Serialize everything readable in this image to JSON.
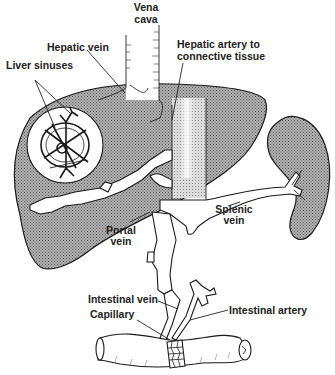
{
  "diagram": {
    "colors": {
      "organ_stipple": "#8a8a8a",
      "background": "#ffffff",
      "ink": "#1a1a1a"
    },
    "labels": {
      "vena_cava_line1": "Vena",
      "vena_cava_line2": "cava",
      "hepatic_vein": "Hepatic vein",
      "hepatic_artery_line1": "Hepatic artery to",
      "hepatic_artery_line2": "connective tissue",
      "liver_sinuses": "Liver sinuses",
      "portal_vein_line1": "Portal",
      "portal_vein_line2": "vein",
      "splenic_vein_line1": "Splenic",
      "splenic_vein_line2": "vein",
      "intestinal_vein": "Intestinal vein",
      "capillary": "Capillary",
      "intestinal_artery": "Intestinal artery"
    },
    "structures": [
      "liver",
      "vena-cava",
      "liver-sinus-inset",
      "spleen",
      "splenic-vein",
      "portal-vein",
      "intestinal-vein",
      "intestinal-artery",
      "intestine",
      "capillary-network"
    ]
  }
}
